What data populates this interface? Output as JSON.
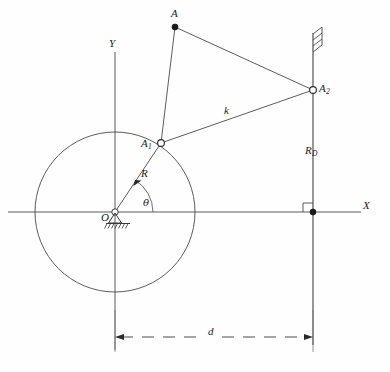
{
  "figure": {
    "background_color": "#fefefe",
    "line_color": "#3a3a3a",
    "text_color": "#1a1a1a"
  },
  "axes": {
    "x_label": "X",
    "y_label": "Y",
    "origin_label": "O"
  },
  "points": {
    "coupler_tip": {
      "label": "A",
      "marker": "filled-dot"
    },
    "crank_pin": {
      "label": "A",
      "subscript": "1",
      "marker": "open-circle"
    },
    "slider_pin": {
      "label": "A",
      "subscript": "2",
      "marker": "open-circle"
    },
    "guide_foot": {
      "marker": "filled-dot"
    }
  },
  "dimensions": {
    "crank_radius": "R",
    "coupler_link": "k",
    "guide_offset": "R",
    "guide_offset_subscript": "D",
    "center_distance": "d",
    "crank_angle": "θ"
  },
  "annotations": {
    "ground_pivot": "ground-hatching",
    "wall_fixed": "wall-hatching",
    "right_angle": "perpendicular-marker"
  }
}
